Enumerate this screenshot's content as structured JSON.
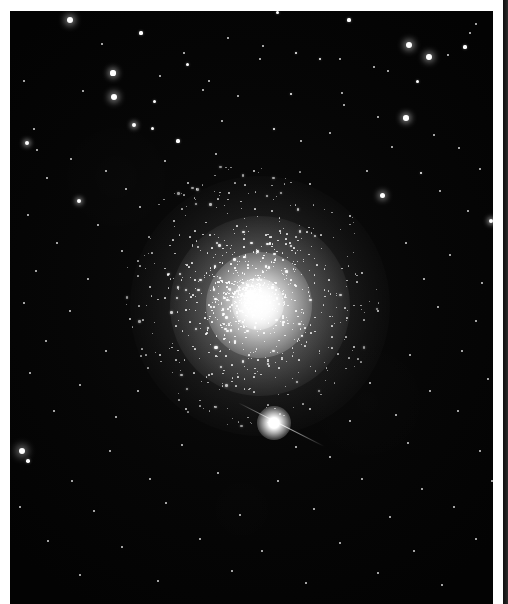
{
  "page": {
    "kind": "printed-plate",
    "background_color": "#ffffff",
    "width": 508,
    "height": 604
  },
  "plate": {
    "name": "globular-cluster-photograph",
    "medium": "black-and-white astronomical photograph",
    "sky_color": "#040404",
    "star_color": "#ffffff",
    "bounds": {
      "x": 10,
      "y": 11,
      "width": 483,
      "height": 593
    }
  },
  "cluster": {
    "label": "globular star cluster",
    "center_x": 250,
    "center_y": 295,
    "core_radius": 53,
    "halo_radius": 130,
    "description": "dense spherical swarm of unresolved and resolved stars, brightest at the nucleus and fading smoothly outward"
  },
  "bright_star": {
    "label": "bright foreground star with diffraction spike",
    "center_x": 264,
    "center_y": 412,
    "spike_angle_deg": 27
  },
  "margins": {
    "left_label": "page-margin-left",
    "top_label": "page-margin-top",
    "gutter_label": "page-gutter",
    "facing_page_label": "facing-page-edge",
    "margin_color": "#ffffff",
    "facing_page_color": "#1a1a1a"
  },
  "chart_data": {
    "type": "scatter",
    "xlabel": "",
    "ylabel": "",
    "xlim": [
      0,
      483
    ],
    "ylim": [
      0,
      593
    ],
    "grid": false,
    "legend": "none",
    "note": "Field star positions (x, y in plate pixels) and apparent brightness radius r in pixels.",
    "field_stars": [
      [
        60,
        9,
        3.2
      ],
      [
        131,
        22,
        1.6
      ],
      [
        267,
        1,
        1.5
      ],
      [
        339,
        9,
        1.6
      ],
      [
        466,
        13,
        1.2
      ],
      [
        92,
        33,
        1.3
      ],
      [
        218,
        27,
        1.2
      ],
      [
        455,
        36,
        1.6
      ],
      [
        460,
        22,
        1.3
      ],
      [
        103,
        62,
        2.6
      ],
      [
        174,
        42,
        1.3
      ],
      [
        177,
        53,
        1.5
      ],
      [
        253,
        35,
        1.1
      ],
      [
        399,
        34,
        3.3
      ],
      [
        491,
        20,
        1.0
      ],
      [
        150,
        65,
        1.1
      ],
      [
        286,
        42,
        1.4
      ],
      [
        330,
        48,
        1.2
      ],
      [
        419,
        46,
        2.9
      ],
      [
        438,
        44,
        1.2
      ],
      [
        14,
        70,
        1.1
      ],
      [
        73,
        80,
        1.3
      ],
      [
        199,
        70,
        1.1
      ],
      [
        250,
        48,
        1.3
      ],
      [
        364,
        56,
        1.3
      ],
      [
        104,
        86,
        3.1
      ],
      [
        144,
        90,
        1.5
      ],
      [
        310,
        48,
        1.4
      ],
      [
        378,
        60,
        1.3
      ],
      [
        24,
        118,
        1.2
      ],
      [
        193,
        79,
        1.1
      ],
      [
        228,
        85,
        1.2
      ],
      [
        281,
        83,
        1.4
      ],
      [
        124,
        114,
        2.2
      ],
      [
        142,
        117,
        1.5
      ],
      [
        332,
        82,
        1.2
      ],
      [
        407,
        70,
        1.5
      ],
      [
        17,
        132,
        2.3
      ],
      [
        27,
        139,
        1.2
      ],
      [
        168,
        130,
        1.6
      ],
      [
        212,
        110,
        1.2
      ],
      [
        334,
        94,
        1.1
      ],
      [
        368,
        106,
        1.2
      ],
      [
        396,
        107,
        2.8
      ],
      [
        61,
        148,
        1.3
      ],
      [
        264,
        118,
        1.4
      ],
      [
        291,
        130,
        1.2
      ],
      [
        424,
        124,
        1.2
      ],
      [
        96,
        160,
        1.3
      ],
      [
        155,
        150,
        1.2
      ],
      [
        206,
        143,
        1.2
      ],
      [
        320,
        122,
        1.1
      ],
      [
        382,
        136,
        1.2
      ],
      [
        449,
        137,
        1.3
      ],
      [
        37,
        167,
        1.2
      ],
      [
        116,
        178,
        1.3
      ],
      [
        178,
        172,
        1.1
      ],
      [
        244,
        160,
        1.2
      ],
      [
        357,
        160,
        1.1
      ],
      [
        411,
        162,
        1.4
      ],
      [
        470,
        158,
        1.2
      ],
      [
        69,
        190,
        2.1
      ],
      [
        130,
        196,
        1.2
      ],
      [
        219,
        182,
        1.2
      ],
      [
        300,
        173,
        1.1
      ],
      [
        372,
        184,
        2.5
      ],
      [
        430,
        180,
        1.3
      ],
      [
        18,
        204,
        1.2
      ],
      [
        88,
        214,
        1.3
      ],
      [
        164,
        210,
        1.1
      ],
      [
        262,
        200,
        1.2
      ],
      [
        340,
        205,
        1.2
      ],
      [
        458,
        200,
        1.2
      ],
      [
        481,
        210,
        2.4
      ],
      [
        47,
        232,
        1.1
      ],
      [
        112,
        240,
        1.2
      ],
      [
        188,
        236,
        1.1
      ],
      [
        286,
        226,
        1.1
      ],
      [
        396,
        232,
        1.2
      ],
      [
        440,
        244,
        1.2
      ],
      [
        26,
        260,
        1.2
      ],
      [
        78,
        268,
        1.3
      ],
      [
        140,
        276,
        1.1
      ],
      [
        352,
        262,
        1.3
      ],
      [
        414,
        268,
        1.2
      ],
      [
        472,
        272,
        1.1
      ],
      [
        14,
        292,
        1.2
      ],
      [
        60,
        300,
        1.1
      ],
      [
        120,
        308,
        1.2
      ],
      [
        368,
        300,
        1.2
      ],
      [
        428,
        296,
        1.2
      ],
      [
        466,
        310,
        1.2
      ],
      [
        36,
        330,
        1.2
      ],
      [
        96,
        340,
        1.3
      ],
      [
        150,
        344,
        1.1
      ],
      [
        344,
        336,
        1.2
      ],
      [
        400,
        344,
        1.2
      ],
      [
        452,
        340,
        1.1
      ],
      [
        20,
        362,
        1.1
      ],
      [
        70,
        374,
        1.2
      ],
      [
        128,
        380,
        1.2
      ],
      [
        360,
        372,
        1.2
      ],
      [
        420,
        380,
        1.2
      ],
      [
        478,
        368,
        1.2
      ],
      [
        44,
        400,
        1.2
      ],
      [
        106,
        406,
        1.2
      ],
      [
        176,
        398,
        1.1
      ],
      [
        300,
        398,
        1.3
      ],
      [
        340,
        410,
        1.2
      ],
      [
        386,
        404,
        1.2
      ],
      [
        448,
        400,
        1.2
      ],
      [
        12,
        440,
        3.4
      ],
      [
        18,
        450,
        1.8
      ],
      [
        100,
        440,
        1.3
      ],
      [
        172,
        434,
        1.2
      ],
      [
        286,
        436,
        1.3
      ],
      [
        320,
        446,
        1.2
      ],
      [
        398,
        432,
        1.3
      ],
      [
        470,
        440,
        1.2
      ],
      [
        62,
        470,
        1.2
      ],
      [
        140,
        468,
        1.2
      ],
      [
        208,
        462,
        1.2
      ],
      [
        268,
        470,
        1.2
      ],
      [
        352,
        468,
        1.3
      ],
      [
        412,
        478,
        1.2
      ],
      [
        482,
        470,
        1.2
      ],
      [
        10,
        496,
        1.2
      ],
      [
        84,
        500,
        1.3
      ],
      [
        156,
        492,
        1.1
      ],
      [
        230,
        504,
        1.2
      ],
      [
        304,
        498,
        1.3
      ],
      [
        380,
        506,
        1.2
      ],
      [
        444,
        496,
        1.2
      ],
      [
        38,
        530,
        1.2
      ],
      [
        112,
        536,
        1.2
      ],
      [
        190,
        528,
        1.2
      ],
      [
        252,
        540,
        1.3
      ],
      [
        330,
        532,
        1.2
      ],
      [
        404,
        540,
        1.2
      ],
      [
        466,
        528,
        1.2
      ],
      [
        70,
        564,
        1.2
      ],
      [
        148,
        570,
        1.2
      ],
      [
        222,
        560,
        1.3
      ],
      [
        296,
        572,
        1.2
      ],
      [
        368,
        562,
        1.2
      ],
      [
        432,
        574,
        1.2
      ],
      [
        486,
        560,
        1.2
      ]
    ]
  }
}
